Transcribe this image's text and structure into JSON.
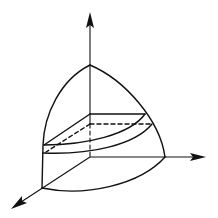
{
  "diagram": {
    "title": "",
    "colors": {
      "stroke": "#111111",
      "background": "#ffffff"
    },
    "axes": [
      {
        "id": "z",
        "direction": "up",
        "label": ""
      },
      {
        "id": "y",
        "direction": "right",
        "label": ""
      },
      {
        "id": "x",
        "direction": "front-left",
        "label": ""
      }
    ],
    "elements": [
      "sphere-octant-outline",
      "slab-top-plane",
      "slab-bottom-plane-hidden",
      "hidden-axis-segment"
    ]
  }
}
